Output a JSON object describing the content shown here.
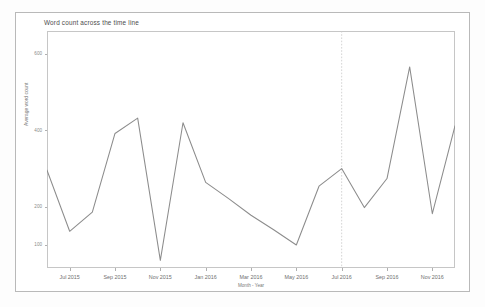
{
  "chart_title": "Word count across the time line",
  "axes": {
    "ylabel": "Average word count",
    "xlabel": "Month - Year",
    "ytick_labels": [
      "600",
      "400",
      "200",
      "100"
    ],
    "xtick_labels": [
      "Jul 2015",
      "Sep 2015",
      "Nov 2015",
      "Jan 2016",
      "Mar 2016",
      "May 2016",
      "Jul 2016",
      "Sep 2016",
      "Nov 2016"
    ]
  },
  "style": {
    "line_color": "#8c8c8c",
    "marker_line_color": "#cfcfcf",
    "frame_color": "#c6c6c6",
    "outer_frame_color": "#b9b9b9",
    "tick_color": "#8a8a8a",
    "background": "#ffffff"
  },
  "chart_data": {
    "type": "line",
    "title": "Word count across the time line",
    "xlabel": "Month - Year",
    "ylabel": "Average word count",
    "grid": false,
    "legend": false,
    "xlim": [
      "2015-06",
      "2016-12"
    ],
    "ylim": [
      40,
      660
    ],
    "ytick_values": [
      600,
      400,
      200,
      100
    ],
    "xtick_values": [
      "Jul 2015",
      "Sep 2015",
      "Nov 2015",
      "Jan 2016",
      "Mar 2016",
      "May 2016",
      "Jul 2016",
      "Sep 2016",
      "Nov 2016"
    ],
    "x": [
      "Jun 2015",
      "Jul 2015",
      "Aug 2015",
      "Sep 2015",
      "Oct 2015",
      "Nov 2015",
      "Dec 2015",
      "Jan 2016",
      "Feb 2016",
      "Mar 2016",
      "Apr 2016",
      "May 2016",
      "Jun 2016",
      "Jul 2016",
      "Aug 2016",
      "Sep 2016",
      "Oct 2016",
      "Nov 2016",
      "Dec 2016"
    ],
    "series": [
      {
        "name": "Average word count",
        "values": [
          296,
          136,
          186,
          392,
          432,
          60,
          420,
          264,
          222,
          178,
          140,
          100,
          254,
          300,
          198,
          274,
          566,
          182,
          412
        ]
      }
    ],
    "annotations": [
      {
        "type": "vertical-reference-line",
        "x": "Jul 2016",
        "style": "dotted",
        "color": "#c9c9c9"
      }
    ]
  }
}
